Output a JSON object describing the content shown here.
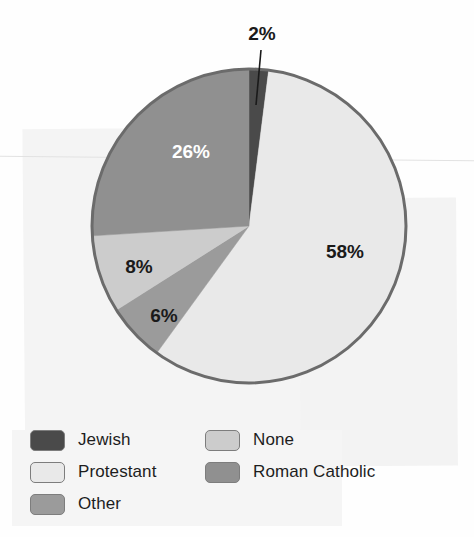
{
  "chart_data": {
    "type": "pie",
    "title": "",
    "categories": [
      "Jewish",
      "Protestant",
      "Other",
      "None",
      "Roman Catholic"
    ],
    "values": [
      2,
      58,
      6,
      8,
      26
    ],
    "value_labels": [
      "2%",
      "58%",
      "6%",
      "8%",
      "26%"
    ],
    "unit": "%",
    "start_angle_deg": 0,
    "direction": "clockwise",
    "legend_position": "bottom",
    "grid": false,
    "colors": {
      "Jewish": "#4a4a4a",
      "Protestant": "#e9e9e9",
      "Other": "#9b9b9b",
      "None": "#cccccc",
      "Roman Catholic": "#909090"
    },
    "slices": [
      {
        "name": "Jewish",
        "value": 2,
        "label": "2%",
        "color": "#4a4a4a",
        "label_color": "#1a1a1a",
        "label_x": 262,
        "label_y": 40,
        "leader_line": true,
        "leader_x1": 261,
        "leader_y1": 50,
        "leader_x2": 256,
        "leader_y2": 105
      },
      {
        "name": "Protestant",
        "value": 58,
        "label": "58%",
        "color": "#e9e9e9",
        "label_color": "#1a1a1a",
        "label_x": 345,
        "label_y": 258,
        "leader_line": false
      },
      {
        "name": "Other",
        "value": 6,
        "label": "6%",
        "color": "#9b9b9b",
        "label_color": "#1a1a1a",
        "label_x": 164,
        "label_y": 322,
        "leader_line": false
      },
      {
        "name": "None",
        "value": 8,
        "label": "8%",
        "color": "#cccccc",
        "label_color": "#1a1a1a",
        "label_x": 139,
        "label_y": 273,
        "leader_line": false
      },
      {
        "name": "Roman Catholic",
        "value": 26,
        "label": "26%",
        "color": "#909090",
        "label_color": "#ffffff",
        "label_x": 191,
        "label_y": 158,
        "leader_line": false
      }
    ],
    "geometry": {
      "center_x": 249,
      "center_y": 226,
      "radius": 157,
      "outline_color": "#6b6b6b",
      "outline_width": 3
    }
  },
  "legend": {
    "columns": [
      {
        "items": [
          {
            "label": "Jewish",
            "color": "#4a4a4a"
          },
          {
            "label": "Protestant",
            "color": "#e9e9e9"
          },
          {
            "label": "Other",
            "color": "#9b9b9b"
          }
        ]
      },
      {
        "items": [
          {
            "label": "None",
            "color": "#cccccc"
          },
          {
            "label": "Roman Catholic",
            "color": "#909090"
          }
        ]
      }
    ]
  }
}
